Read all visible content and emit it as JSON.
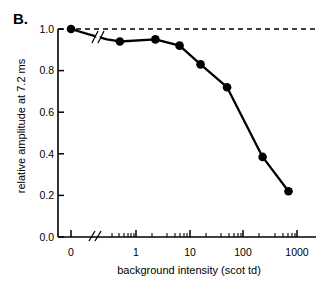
{
  "figure": {
    "panel_label": "B."
  },
  "chart_data": {
    "type": "line",
    "title": "",
    "subtitle": "",
    "xlabel": "background intensity (scot td)",
    "ylabel": "relative amplitude at 7.2 ms",
    "x_scale": "log-with-zero-break",
    "x_axis_break": true,
    "x_break_symbol": "//",
    "xlim": [
      0.25,
      1000
    ],
    "ylim": [
      0.0,
      1.0
    ],
    "grid": false,
    "legend": "none",
    "x_tick_labels": [
      "0",
      "1",
      "10",
      "100",
      "1000"
    ],
    "x_tick_values": [
      0,
      1,
      10,
      100,
      1000
    ],
    "y_tick_labels": [
      "0.0",
      "0.2",
      "0.4",
      "0.6",
      "0.8",
      "1.0"
    ],
    "y_tick_values": [
      0.0,
      0.2,
      0.4,
      0.6,
      0.8,
      1.0
    ],
    "series": [
      {
        "name": "relative amplitude",
        "marker": "filled-circle",
        "color": "#000000",
        "x": [
          0,
          0.5,
          2.3,
          6.5,
          16,
          50,
          230,
          700
        ],
        "y": [
          1.0,
          0.94,
          0.95,
          0.92,
          0.83,
          0.72,
          0.385,
          0.22
        ]
      }
    ],
    "annotations": [
      {
        "type": "reference-line",
        "style": "dashed",
        "orientation": "horizontal",
        "y": 1.0,
        "label": ""
      },
      {
        "type": "axis-break-mark",
        "label": "//",
        "on": "data-curve"
      },
      {
        "type": "axis-break-mark",
        "label": "//",
        "on": "x-axis"
      }
    ]
  }
}
